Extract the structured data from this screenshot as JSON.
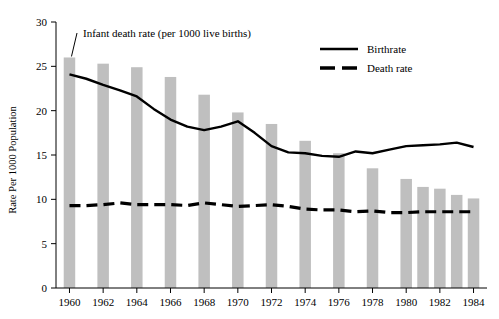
{
  "chart_data": {
    "type": "bar",
    "title": "",
    "subtitle": "",
    "xlabel": "",
    "ylabel": "Rate Per 1000 Population",
    "xlim": [
      1959.2,
      1984.8
    ],
    "ylim": [
      0,
      30
    ],
    "grid": false,
    "legend_position": "top-right",
    "y_ticks": [
      "0",
      "5",
      "10",
      "15",
      "20",
      "25",
      "30"
    ],
    "y_tick_values": [
      0,
      5,
      10,
      15,
      20,
      25,
      30
    ],
    "x_ticks": [
      "1960",
      "1962",
      "1964",
      "1966",
      "1968",
      "1970",
      "1972",
      "1974",
      "1976",
      "1978",
      "1980",
      "1982",
      "1984"
    ],
    "x_tick_values": [
      1960,
      1962,
      1964,
      1966,
      1968,
      1970,
      1972,
      1974,
      1976,
      1978,
      1980,
      1982,
      1984
    ],
    "bars": {
      "name": "Infant death rate (per 1000 live births)",
      "color": "#bfbfbf",
      "x": [
        1960,
        1962,
        1964,
        1966,
        1968,
        1970,
        1972,
        1974,
        1976,
        1978,
        1980,
        1981,
        1982,
        1983,
        1984
      ],
      "values": [
        26.0,
        25.3,
        24.9,
        23.8,
        21.8,
        19.8,
        18.5,
        16.6,
        15.2,
        13.5,
        12.3,
        11.4,
        11.2,
        10.5,
        10.1
      ]
    },
    "series": [
      {
        "name": "Birthrate",
        "style": "solid",
        "color": "#000000",
        "x": [
          1960,
          1961,
          1962,
          1963,
          1964,
          1965,
          1966,
          1967,
          1968,
          1969,
          1970,
          1971,
          1972,
          1973,
          1974,
          1975,
          1976,
          1977,
          1978,
          1979,
          1980,
          1981,
          1982,
          1983,
          1984
        ],
        "values": [
          24.1,
          23.6,
          22.9,
          22.3,
          21.6,
          20.2,
          19.0,
          18.2,
          17.8,
          18.2,
          18.8,
          17.5,
          16.0,
          15.3,
          15.2,
          14.9,
          14.8,
          15.4,
          15.2,
          15.6,
          16.0,
          16.1,
          16.2,
          16.4,
          15.9
        ]
      },
      {
        "name": "Death rate",
        "style": "dashed",
        "color": "#000000",
        "x": [
          1960,
          1961,
          1962,
          1963,
          1964,
          1965,
          1966,
          1967,
          1968,
          1969,
          1970,
          1971,
          1972,
          1973,
          1974,
          1975,
          1976,
          1977,
          1978,
          1979,
          1980,
          1981,
          1982,
          1983,
          1984
        ],
        "values": [
          9.3,
          9.3,
          9.4,
          9.6,
          9.4,
          9.4,
          9.4,
          9.3,
          9.6,
          9.4,
          9.2,
          9.3,
          9.4,
          9.2,
          8.9,
          8.8,
          8.8,
          8.6,
          8.7,
          8.5,
          8.5,
          8.6,
          8.6,
          8.6,
          8.6
        ]
      }
    ],
    "annotations": [
      {
        "text": "Infant death rate (per 1000 live births)",
        "points_to_x": 1960,
        "points_to_y": 26.0
      }
    ],
    "legend": [
      {
        "label": "Birthrate",
        "style": "solid"
      },
      {
        "label": "Death rate",
        "style": "dashed"
      }
    ]
  }
}
